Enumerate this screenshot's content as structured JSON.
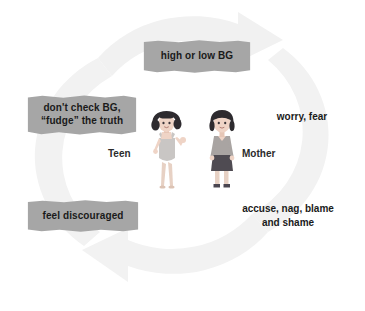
{
  "diagram": {
    "type": "cycle",
    "title": "",
    "background_color": "#ffffff",
    "ring_color": "#f2f2f2",
    "tag_color": "#a6a6a6",
    "text_color": "#1a1a1a",
    "nodes": [
      {
        "id": "high-or-low-bg",
        "label": "high or low BG",
        "style": "tag",
        "position": "top"
      },
      {
        "id": "worry-fear",
        "label": "worry, fear",
        "style": "plain",
        "position": "right"
      },
      {
        "id": "accuse-nag-blame",
        "label": "accuse, nag, blame\nand shame",
        "style": "plain",
        "position": "bottom-right"
      },
      {
        "id": "feel-discouraged",
        "label": "feel discouraged",
        "style": "tag",
        "position": "bottom-left"
      },
      {
        "id": "dont-check-bg",
        "label": "don't check BG,\n“fudge” the truth",
        "style": "tag",
        "position": "left"
      }
    ],
    "figures": [
      {
        "id": "teen",
        "caption": "Teen",
        "hair_color": "#2e2b2f",
        "skin_color": "#efd4c6",
        "outfit_color": "#c9c6c4"
      },
      {
        "id": "mother",
        "caption": "Mother",
        "hair_color": "#2e2b2f",
        "skin_color": "#efd4c6",
        "top_color": "#a9a4a2",
        "skirt_color": "#4f4b52"
      }
    ],
    "arrows": [
      {
        "id": "arrow-top",
        "direction": "clockwise-right"
      },
      {
        "id": "arrow-bottom",
        "direction": "clockwise-left"
      }
    ]
  }
}
